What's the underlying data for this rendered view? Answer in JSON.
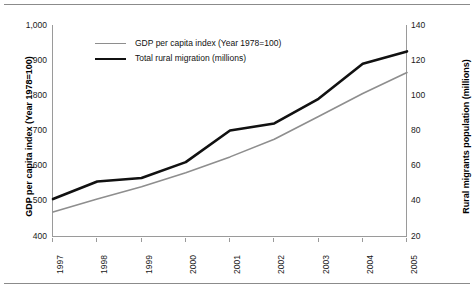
{
  "page": {
    "rule_top": "horizontal-rule",
    "rule_bottom": "horizontal-rule"
  },
  "chart_data": {
    "type": "line",
    "title": "",
    "xlabel": "",
    "grid": false,
    "legend_position": "top-left-inside",
    "categories": [
      "1997",
      "1998",
      "1999",
      "2000",
      "2001",
      "2002",
      "2003",
      "2004",
      "2005"
    ],
    "axes": {
      "left": {
        "label": "GDP per capita index (Year 1978=100)",
        "ticks": [
          "400",
          "500",
          "600",
          "700",
          "800",
          "900",
          "1,000"
        ],
        "tick_values": [
          400,
          500,
          600,
          700,
          800,
          900,
          1000
        ],
        "ylim": [
          400,
          1000
        ]
      },
      "right": {
        "label": "Rural migrants population (millions)",
        "ticks": [
          "20",
          "40",
          "60",
          "80",
          "100",
          "120",
          "140"
        ],
        "tick_values": [
          20,
          40,
          60,
          80,
          100,
          120,
          140
        ],
        "ylim": [
          20,
          140
        ]
      }
    },
    "series": [
      {
        "name": "GDP per capita index (Year 1978=100)",
        "axis": "left",
        "color": "#8e8e8e",
        "width": 1.6,
        "values": [
          468,
          505,
          540,
          580,
          625,
          675,
          740,
          805,
          865
        ]
      },
      {
        "name": "Total rural migration (millions)",
        "axis": "right",
        "color": "#111111",
        "width": 2.6,
        "values": [
          41,
          51,
          53,
          62,
          80,
          84,
          98,
          118,
          125
        ]
      }
    ]
  }
}
